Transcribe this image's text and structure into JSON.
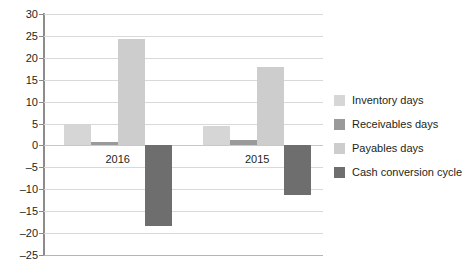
{
  "chart_data": {
    "type": "bar",
    "title": "",
    "subtitle": "",
    "xlabel": "",
    "ylabel": "",
    "categories": [
      "2016",
      "2015"
    ],
    "series": [
      {
        "name": "Inventory days",
        "values": [
          5.0,
          4.4
        ],
        "color": "#d6d6d6"
      },
      {
        "name": "Receivables days",
        "values": [
          0.7,
          1.3
        ],
        "color": "#9a9a9a"
      },
      {
        "name": "Payables days",
        "values": [
          24.3,
          17.8
        ],
        "color": "#cdcdcd"
      },
      {
        "name": "Cash conversion cycle",
        "values": [
          -18.3,
          -11.4
        ],
        "color": "#6e6e6e"
      }
    ],
    "ylim": [
      -25,
      30
    ],
    "ytick_step": 5,
    "yticks": [
      30,
      25,
      20,
      15,
      10,
      5,
      0,
      -5,
      -10,
      -15,
      -20,
      -25
    ],
    "ytick_labels": [
      "30",
      "25",
      "20",
      "15",
      "10",
      "5",
      "0",
      "–5",
      "–10",
      "–15",
      "–20",
      "–25"
    ],
    "grid": true,
    "grid_color": "#d9d9d9",
    "legend_position": "right",
    "background": "#ffffff",
    "axis_color": "#8c8c8c",
    "text_color": "#231f20"
  }
}
